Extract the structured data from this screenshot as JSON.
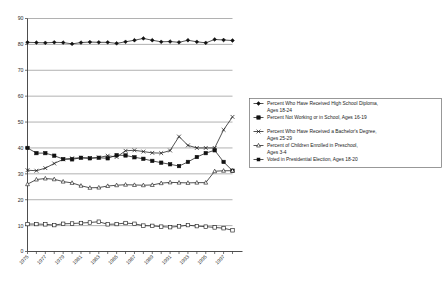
{
  "chart_data": {
    "type": "line",
    "title": "",
    "xlabel": "",
    "ylabel": "",
    "ylim": [
      0,
      90
    ],
    "ytick_step": 10,
    "yticks": [
      0,
      10,
      20,
      30,
      40,
      50,
      60,
      70,
      80,
      90
    ],
    "grid": true,
    "legend_position": "right",
    "x": [
      1975,
      1976,
      1977,
      1978,
      1979,
      1980,
      1981,
      1982,
      1983,
      1984,
      1985,
      1986,
      1987,
      1988,
      1989,
      1990,
      1991,
      1992,
      1993,
      1994,
      1995,
      1996,
      1997,
      1998
    ],
    "xtick_labels": [
      "1975",
      "1977",
      "1979",
      "1981",
      "1983",
      "1985",
      "1987",
      "1989",
      "1991",
      "1993",
      "1995",
      "1997"
    ],
    "xtick_label_every": 2,
    "series": [
      {
        "name": "Percent Who Have Received High School Diploma, Ages 18-24",
        "marker": "filled-diamond",
        "values": [
          80.8,
          80.7,
          80.6,
          80.8,
          80.7,
          80.2,
          80.7,
          80.9,
          80.8,
          80.8,
          80.4,
          81.0,
          81.6,
          82.3,
          81.6,
          81.0,
          81.1,
          80.8,
          81.6,
          81.0,
          80.6,
          81.9,
          81.7,
          81.5
        ]
      },
      {
        "name": "Percent Not Working or in School, Ages 16-19",
        "marker": "filled-square",
        "values": [
          40.0,
          38.0,
          38.0,
          37.0,
          35.7,
          35.6,
          36.2,
          36.0,
          36.2,
          36.0,
          37.2,
          37.1,
          36.4,
          35.8,
          35.0,
          34.3,
          33.7,
          33.0,
          34.6,
          36.5,
          38.0,
          39.1,
          34.6,
          31.2
        ]
      },
      {
        "name": "Percent Who Have Received a Bachelor's Degree, Ages 25-29",
        "marker": "open-x",
        "values": [
          31.4,
          31.2,
          32.2,
          34.0,
          35.6,
          36.0,
          36.2,
          36.1,
          36.3,
          37.0,
          36.5,
          38.9,
          39.1,
          38.6,
          38.1,
          38.0,
          39.0,
          44.4,
          41.0,
          40.0,
          40.0,
          40.0,
          47.0,
          52.0
        ]
      },
      {
        "name": "Percent of Children Enrolled in Preschool, Ages 3-4",
        "marker": "open-triangle",
        "values": [
          26.0,
          27.8,
          28.2,
          27.9,
          27.0,
          26.5,
          25.4,
          24.6,
          24.7,
          25.3,
          25.6,
          25.8,
          25.7,
          25.6,
          25.7,
          26.4,
          26.7,
          26.6,
          26.5,
          26.6,
          26.6,
          31.0,
          31.2,
          31.2
        ]
      },
      {
        "name": "Voted in Presidential Election, Ages 18-20",
        "marker": "open-square",
        "values": [
          10.6,
          10.6,
          10.5,
          10.2,
          10.7,
          10.8,
          11.0,
          11.2,
          11.5,
          10.5,
          10.6,
          11.0,
          10.7,
          10.0,
          9.9,
          9.6,
          9.4,
          9.7,
          10.2,
          9.8,
          9.6,
          9.3,
          9.0,
          8.2
        ]
      }
    ]
  },
  "legend": {
    "items": [
      {
        "label": "Percent Who Have Received High School Diploma, Ages 18-24",
        "marker": "filled-diamond"
      },
      {
        "label": "Percent Not Working or in School, Ages 16-19",
        "marker": "filled-square"
      },
      {
        "label": "Percent Who Have Received a Bachelor's Degree, Ages 25-29",
        "marker": "open-x"
      },
      {
        "label": "Percent of Children Enrolled in Preschool, Ages 3-4",
        "marker": "open-triangle"
      },
      {
        "label": "Voted in Presidential Election, Ages 18-20",
        "marker": "filled-square-small"
      }
    ]
  },
  "colors": {
    "ink": "#111111",
    "grid": "#8f8f8f",
    "axis": "#3a3a3a",
    "background": "#ffffff"
  }
}
